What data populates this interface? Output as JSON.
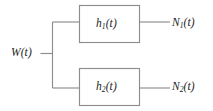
{
  "figure": {
    "type": "block-diagram",
    "background_color": "#ffffff",
    "line_color": "#8d8d8d",
    "text_color": "#232323"
  },
  "input": {
    "name": "W",
    "symbol": "W",
    "subscript": "",
    "argument": "(t)",
    "label": "W(t)"
  },
  "blocks": [
    {
      "id": "block-h1",
      "symbol": "h",
      "subscript": "1",
      "argument": "(t)",
      "label": "h1(t)"
    },
    {
      "id": "block-h2",
      "symbol": "h",
      "subscript": "2",
      "argument": "(t)",
      "label": "h2(t)"
    }
  ],
  "outputs": [
    {
      "id": "output-n1",
      "symbol": "N",
      "subscript": "1",
      "argument": "(t)",
      "label": "N1(t)"
    },
    {
      "id": "output-n2",
      "symbol": "N",
      "subscript": "2",
      "argument": "(t)",
      "label": "N2(t)"
    }
  ],
  "connections": [
    {
      "id": "wire-input",
      "from": "W(t)",
      "to": "branch-node"
    },
    {
      "id": "wire-branch-vertical",
      "from": "branch-node",
      "to": "branch-node"
    },
    {
      "id": "wire-branch-top",
      "from": "branch-node",
      "to": "h1(t)"
    },
    {
      "id": "wire-branch-bottom",
      "from": "branch-node",
      "to": "h2(t)"
    },
    {
      "id": "wire-out-top",
      "from": "h1(t)",
      "to": "N1(t)"
    },
    {
      "id": "wire-out-bottom",
      "from": "h2(t)",
      "to": "N2(t)"
    }
  ]
}
